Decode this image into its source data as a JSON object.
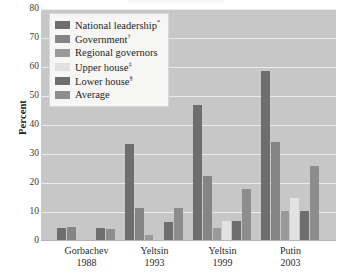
{
  "chart_data": {
    "type": "bar",
    "title": "",
    "xlabel": "",
    "ylabel": "Percent",
    "ylim": [
      0,
      80
    ],
    "yticks": [
      0,
      10,
      20,
      30,
      40,
      50,
      60,
      70,
      80
    ],
    "grid": true,
    "legend_position": "top-left",
    "categories": [
      "Gorbachev 1988",
      "Yeltsin 1993",
      "Yeltsin 1999",
      "Putin 2003"
    ],
    "category_lines": [
      {
        "name": "Gorbachev",
        "year": "1988"
      },
      {
        "name": "Yeltsin",
        "year": "1993"
      },
      {
        "name": "Yeltsin",
        "year": "1999"
      },
      {
        "name": "Putin",
        "year": "2003"
      }
    ],
    "series": [
      {
        "name": "National leadership",
        "marker": "*",
        "color": "#6e6e6e",
        "values": [
          4.5,
          33.5,
          47.0,
          58.5
        ]
      },
      {
        "name": "Government",
        "marker": "†",
        "color": "#858585",
        "values": [
          5.0,
          11.5,
          22.5,
          34.0
        ]
      },
      {
        "name": "Regional governors",
        "marker": "",
        "color": "#9a9a9a",
        "values": [
          0.0,
          2.0,
          4.5,
          10.5
        ]
      },
      {
        "name": "Upper house",
        "marker": "‡",
        "color": "#e2e2e2",
        "values": [
          0.0,
          0.0,
          7.0,
          15.0
        ]
      },
      {
        "name": "Lower house",
        "marker": "§",
        "color": "#6e6e6e",
        "values": [
          4.5,
          6.5,
          7.0,
          10.5
        ]
      },
      {
        "name": "Average",
        "marker": "",
        "color": "#8d8d8d",
        "values": [
          4.0,
          11.5,
          18.0,
          26.0
        ]
      }
    ]
  },
  "legend": {
    "items": [
      {
        "label": "National leadership",
        "sup": "*"
      },
      {
        "label": "Government",
        "sup": "†"
      },
      {
        "label": "Regional governors",
        "sup": ""
      },
      {
        "label": "Upper house",
        "sup": "‡"
      },
      {
        "label": "Lower house",
        "sup": "§"
      },
      {
        "label": "Average",
        "sup": ""
      }
    ]
  },
  "colors": {
    "plot_background": "#c7c7c7",
    "gridline": "#ececeb",
    "legend_background": "#f6f6f4",
    "text": "#1f1f1f"
  }
}
